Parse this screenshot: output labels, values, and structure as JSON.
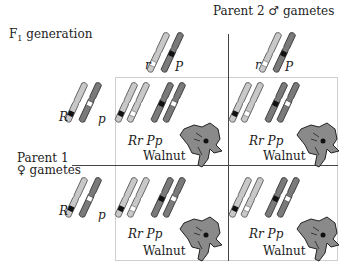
{
  "header": {
    "f1_label_main": "F",
    "f1_label_sub": "1",
    "f1_label_rest": " generation",
    "parent2_label": "Parent 2",
    "parent2_symbol": "♂",
    "parent2_suffix": " gametes",
    "parent1_label": "Parent 1",
    "parent1_symbol": "♀",
    "parent1_suffix": " gametes"
  },
  "parent2_gametes": [
    {
      "allele_r": "r",
      "allele_p": "P"
    },
    {
      "allele_r": "r",
      "allele_p": "P"
    }
  ],
  "parent1_gametes": [
    {
      "allele_r": "R",
      "allele_p": "p"
    },
    {
      "allele_r": "R",
      "allele_p": "p"
    }
  ],
  "cells": [
    {
      "genotype": "Rr Pp",
      "phenotype": "Walnut",
      "icon": "rooster-head-icon"
    },
    {
      "genotype": "Rr Pp",
      "phenotype": "Walnut",
      "icon": "rooster-head-icon"
    },
    {
      "genotype": "Rr Pp",
      "phenotype": "Walnut",
      "icon": "rooster-head-icon"
    },
    {
      "genotype": "Rr Pp",
      "phenotype": "Walnut",
      "icon": "rooster-head-icon"
    }
  ],
  "colors": {
    "light_chromosome": "#c8c8c8",
    "dark_chromosome": "#7a7a7a",
    "band_dark": "#111111",
    "band_light": "#ffffff",
    "grid_line": "#444444",
    "box_border": "#cfcfcf",
    "rooster": "#8a8a8a"
  }
}
